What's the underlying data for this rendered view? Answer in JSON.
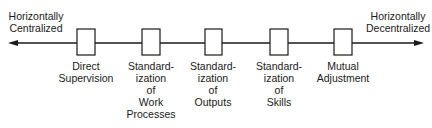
{
  "diagram": {
    "type": "continuum",
    "left_end": {
      "label": "Horizontally\nCentralized",
      "line1": "Horizontally",
      "line2": "Centralized"
    },
    "right_end": {
      "label": "Horizontally\nDecentralized",
      "line1": "Horizontally",
      "line2": "Decentralized"
    },
    "mechanisms": [
      {
        "label": "Direct\nSupervision",
        "center_x": 86
      },
      {
        "label": "Standard-\nization\nof\nWork\nProcesses",
        "center_x": 151
      },
      {
        "label": "Standard-\nization\nof\nOutputs",
        "center_x": 213
      },
      {
        "label": "Standard-\nization\nof\nSkills",
        "center_x": 279
      },
      {
        "label": "Mutual\nAdjustment",
        "center_x": 343
      }
    ],
    "colors": {
      "line": "#1a1a1a",
      "box_fill": "#ffffff",
      "text": "#1a1a1a"
    }
  }
}
